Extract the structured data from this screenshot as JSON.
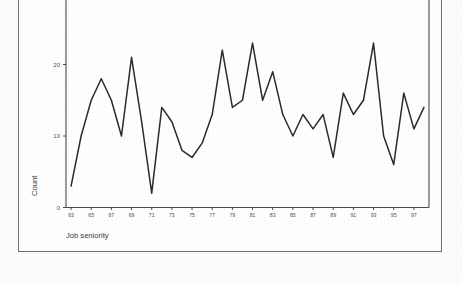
{
  "figure": {
    "background_color": "#ffffff",
    "frame_color": "#6e6e6e",
    "line_color": "#2b2b2b"
  },
  "axis": {
    "y_title": "Count",
    "x_title": "Job seniority"
  },
  "chart_data": {
    "type": "line",
    "title": "",
    "subtitle": "",
    "xlabel": "Job seniority",
    "ylabel": "Count",
    "xlim": [
      62.5,
      98.5
    ],
    "ylim": [
      0,
      30
    ],
    "grid": false,
    "legend": null,
    "y_ticks": [
      0,
      10,
      20,
      30
    ],
    "y_tick_labels": [
      "0",
      "10",
      "20",
      "30"
    ],
    "x_ticks": [
      63,
      65,
      67,
      69,
      71,
      73,
      75,
      77,
      79,
      81,
      83,
      85,
      87,
      89,
      91,
      93,
      95,
      97
    ],
    "x_tick_labels": [
      "63",
      "65",
      "67",
      "69",
      "71",
      "73",
      "75",
      "77",
      "79",
      "81",
      "83",
      "85",
      "87",
      "89",
      "91",
      "93",
      "95",
      "97"
    ],
    "x": [
      63,
      64,
      65,
      66,
      67,
      68,
      69,
      70,
      71,
      72,
      73,
      74,
      75,
      76,
      77,
      78,
      79,
      80,
      81,
      82,
      83,
      84,
      85,
      86,
      87,
      88,
      89,
      90,
      91,
      92,
      93,
      94,
      95,
      96,
      97,
      98
    ],
    "values": [
      3,
      10,
      15,
      18,
      15,
      10,
      21,
      12,
      2,
      14,
      12,
      8,
      7,
      9,
      13,
      22,
      14,
      15,
      23,
      15,
      19,
      13,
      10,
      13,
      11,
      13,
      7,
      16,
      13,
      15,
      23,
      10,
      6,
      16,
      11,
      14
    ],
    "series": [
      {
        "name": "Count",
        "values": [
          3,
          10,
          15,
          18,
          15,
          10,
          21,
          12,
          2,
          14,
          12,
          8,
          7,
          9,
          13,
          22,
          14,
          15,
          23,
          15,
          19,
          13,
          10,
          13,
          11,
          13,
          7,
          16,
          13,
          15,
          23,
          10,
          6,
          16,
          11,
          14
        ]
      }
    ]
  }
}
